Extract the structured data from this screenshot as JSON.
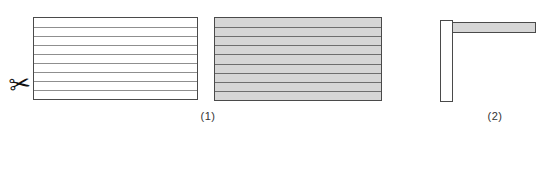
{
  "colors": {
    "background": "#ffffff",
    "unshaded_fill": "#ffffff",
    "shaded_fill": "#d6d6d6",
    "border": "#4a4a4a",
    "label_text": "#333333"
  },
  "icons": {
    "scissors_glyph": "✂"
  },
  "figures": {
    "fig1": {
      "label": "(1)",
      "left_rect": {
        "strips": 9,
        "shaded": false,
        "line_color": "#8f8f8f"
      },
      "right_rect": {
        "strips": 9,
        "shaded": true,
        "line_color": "#6e6e6e"
      }
    },
    "fig2": {
      "label": "(2)",
      "vertical_strip": {
        "shaded": false
      },
      "horizontal_strip": {
        "shaded": true
      }
    }
  }
}
